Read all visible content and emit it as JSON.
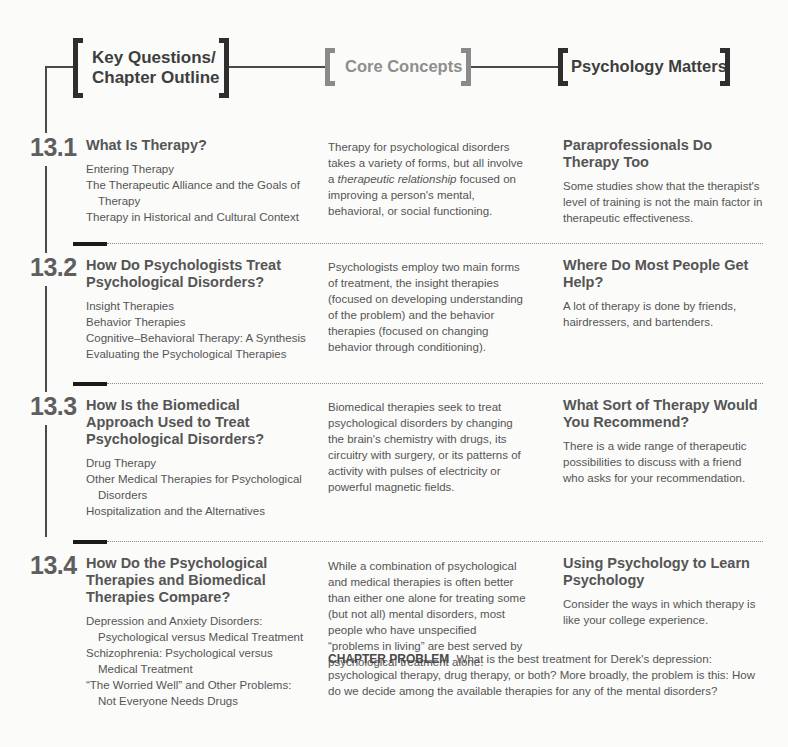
{
  "header": {
    "key_questions_label_line1": "Key Questions/",
    "key_questions_label_line2": "Chapter Outline",
    "core_concepts_label": "Core Concepts",
    "psychology_matters_label": "Psychology Matters"
  },
  "sections": [
    {
      "number": "13.1",
      "key_question": "What Is Therapy?",
      "outline": [
        "Entering Therapy",
        "The Therapeutic Alliance and the Goals of Therapy",
        "Therapy in Historical and Cultural Context"
      ],
      "core_concept_pre": "Therapy for psychological disorders takes a variety of forms, but all involve a ",
      "core_concept_italic": "therapeutic relationship",
      "core_concept_post": " focused on improving a person's mental, behavioral, or social functioning.",
      "psych_matters_title": "Paraprofessionals Do Therapy Too",
      "psych_matters_text": "Some studies show that the therapist's level of training is not the main factor in therapeutic effectiveness."
    },
    {
      "number": "13.2",
      "key_question": "How Do Psychologists Treat Psychological Disorders?",
      "outline": [
        "Insight Therapies",
        "Behavior Therapies",
        "Cognitive–Behavioral Therapy: A Synthesis",
        "Evaluating the Psychological Therapies"
      ],
      "core_concept": "Psychologists employ two main forms of treatment, the insight therapies (focused on developing understanding of the problem) and the behavior therapies (focused on changing behavior through conditioning).",
      "psych_matters_title": "Where Do Most People Get Help?",
      "psych_matters_text": "A lot of therapy is done by friends, hairdressers, and bartenders."
    },
    {
      "number": "13.3",
      "key_question": "How Is the Biomedical Approach Used to Treat Psychological Disorders?",
      "outline": [
        "Drug Therapy",
        "Other Medical Therapies for Psychological Disorders",
        "Hospitalization and the Alternatives"
      ],
      "core_concept": "Biomedical therapies seek to treat psychological disorders by changing the brain's chemistry with drugs, its circuitry with surgery, or its patterns of activity with pulses of electricity or powerful magnetic fields.",
      "psych_matters_title": "What Sort of Therapy Would You Recommend?",
      "psych_matters_text": "There is a wide range of therapeutic possibilities to discuss with a friend who asks for your recommendation."
    },
    {
      "number": "13.4",
      "key_question": "How Do the Psychological Therapies and Biomedical Therapies Compare?",
      "outline": [
        "Depression and Anxiety Disorders: Psychological versus Medical Treatment",
        "Schizophrenia: Psychological versus Medical Treatment",
        "“The Worried Well” and Other Problems: Not Everyone Needs Drugs"
      ],
      "core_concept": "While a combination of psychological and medical therapies is often better than either one alone for treating some (but not all) mental disorders, most people who have unspecified “problems in living” are best served by psychological treatment alone.",
      "psych_matters_title": "Using Psychology to Learn Psychology",
      "psych_matters_text": "Consider the ways in which therapy is like your college experience."
    }
  ],
  "chapter_problem": {
    "label": "CHAPTER PROBLEM",
    "text": "What is the best treatment for Derek's depression: psychological therapy, drug therapy, or both? More broadly, the problem is this: How do we decide among the available therapies for any of the mental disorders?"
  }
}
